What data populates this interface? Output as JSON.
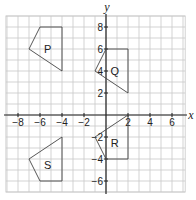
{
  "chart_data": {
    "type": "diagram",
    "title": "",
    "xlabel": "x",
    "ylabel": "y",
    "xlim": [
      -9,
      7
    ],
    "ylim": [
      -7,
      9
    ],
    "grid": true,
    "x_ticks": [
      -8,
      -6,
      -4,
      -2,
      2,
      4,
      6
    ],
    "y_ticks": [
      8,
      6,
      4,
      2,
      -2,
      -4,
      -6
    ],
    "shapes": [
      {
        "label": "P",
        "vertices": [
          [
            -6,
            8
          ],
          [
            -4,
            8
          ],
          [
            -4,
            4
          ],
          [
            -7,
            6
          ]
        ],
        "label_pos": [
          -5.3,
          6
        ]
      },
      {
        "label": "Q",
        "vertices": [
          [
            0,
            6
          ],
          [
            2,
            6
          ],
          [
            2,
            2
          ],
          [
            -1,
            4
          ]
        ],
        "label_pos": [
          0.8,
          4
        ]
      },
      {
        "label": "R",
        "vertices": [
          [
            2,
            0
          ],
          [
            2,
            -4
          ],
          [
            0,
            -4
          ],
          [
            -1,
            -2
          ]
        ],
        "label_pos": [
          0.8,
          -2.5
        ]
      },
      {
        "label": "S",
        "vertices": [
          [
            -4,
            -2
          ],
          [
            -4,
            -6
          ],
          [
            -6,
            -6
          ],
          [
            -7,
            -4
          ]
        ],
        "label_pos": [
          -5.3,
          -4.5
        ]
      }
    ]
  },
  "layout": {
    "origin_px": [
      106,
      115
    ],
    "unit_px": 11,
    "grid_x_range": [
      -9.1,
      7.2
    ],
    "grid_y_range": [
      -7.0,
      9.0
    ],
    "colors": {
      "grid": "#c8c8c8",
      "axis": "#222222",
      "shape": "#444444",
      "text": "#222222"
    }
  }
}
